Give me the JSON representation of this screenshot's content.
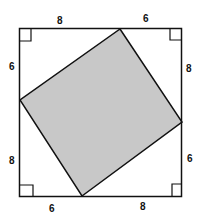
{
  "diagram": {
    "type": "square inscribed in square (Pythagorean proof)",
    "colors": {
      "outline": "#111111",
      "shaded_fill": "#c8c8c8",
      "background": "#ffffff"
    },
    "labels": {
      "top_left_segment": "8",
      "top_right_segment": "6",
      "right_top_segment": "8",
      "right_bottom_segment": "6",
      "bottom_right_segment": "8",
      "bottom_left_segment": "6",
      "left_bottom_segment": "8",
      "left_top_segment": "6"
    },
    "right_angle_marks": [
      "top-left",
      "top-right",
      "bottom-left",
      "bottom-right"
    ]
  }
}
